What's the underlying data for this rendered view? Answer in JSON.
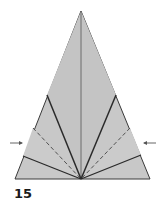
{
  "step": {
    "number": "15"
  },
  "colors": {
    "paper": "#c8c8c8",
    "outline": "#3a3a3a",
    "fold_line": "#2a2a2a",
    "arrow": "#555555",
    "background": "#ffffff"
  },
  "figure": {
    "shape": "triangle",
    "apex": [
      81,
      11
    ],
    "base_left": [
      15,
      179
    ],
    "base_right": [
      150,
      179
    ],
    "center_bottom": [
      81,
      179
    ],
    "folds": [
      {
        "type": "valley-solid",
        "from": [
          81,
          11
        ],
        "to": [
          81,
          179
        ]
      },
      {
        "type": "solid",
        "from": [
          47,
          95
        ],
        "to": [
          81,
          179
        ]
      },
      {
        "type": "solid",
        "from": [
          116,
          95
        ],
        "to": [
          81,
          179
        ]
      },
      {
        "type": "dashed",
        "from": [
          33,
          128
        ],
        "to": [
          81,
          179
        ]
      },
      {
        "type": "dashed",
        "from": [
          130,
          128
        ],
        "to": [
          81,
          179
        ]
      },
      {
        "type": "solid",
        "from": [
          23,
          156
        ],
        "to": [
          81,
          179
        ]
      },
      {
        "type": "solid",
        "from": [
          141,
          155
        ],
        "to": [
          81,
          179
        ]
      }
    ],
    "arrows": [
      {
        "direction": "right",
        "at": [
          22,
          143
        ]
      },
      {
        "direction": "left",
        "at": [
          144,
          143
        ]
      }
    ]
  }
}
